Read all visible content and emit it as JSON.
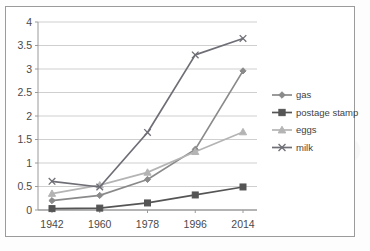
{
  "chart_data": {
    "type": "line",
    "title": "",
    "xlabel": "",
    "ylabel": "",
    "categories": [
      "1942",
      "1960",
      "1978",
      "1996",
      "2014"
    ],
    "ylim": [
      0,
      4
    ],
    "ytick_labels": [
      "0",
      "0.5",
      "1",
      "1.5",
      "2",
      "2.5",
      "3",
      "3.5",
      "4"
    ],
    "ytick_values": [
      0,
      0.5,
      1,
      1.5,
      2,
      2.5,
      3,
      3.5,
      4
    ],
    "grid": "horizontal",
    "legend_position": "right",
    "series": [
      {
        "name": "gas",
        "marker": "diamond",
        "color": "#8a8a8a",
        "values": [
          0.2,
          0.31,
          0.65,
          1.29,
          2.96
        ]
      },
      {
        "name": "postage stamp",
        "marker": "square",
        "color": "#555555",
        "values": [
          0.03,
          0.04,
          0.15,
          0.32,
          0.49
        ]
      },
      {
        "name": "eggs",
        "marker": "triangle",
        "color": "#b4b4b4",
        "values": [
          0.35,
          0.53,
          0.8,
          1.24,
          1.66
        ]
      },
      {
        "name": "milk",
        "marker": "x",
        "color": "#6e6e76",
        "values": [
          0.61,
          0.49,
          1.65,
          3.3,
          3.65
        ]
      }
    ]
  },
  "legend": {
    "entries": [
      {
        "label": "gas"
      },
      {
        "label": "postage stamp"
      },
      {
        "label": "eggs"
      },
      {
        "label": "milk"
      }
    ]
  },
  "colors": {
    "gas": "#8a8a8a",
    "postage_stamp": "#555555",
    "eggs": "#b4b4b4",
    "milk": "#6e6e76",
    "gridline": "#cfcfcf",
    "axis": "#9a9a9a",
    "frame": "#9b9b9b",
    "text": "#4a4a4a",
    "background": "#ffffff"
  }
}
